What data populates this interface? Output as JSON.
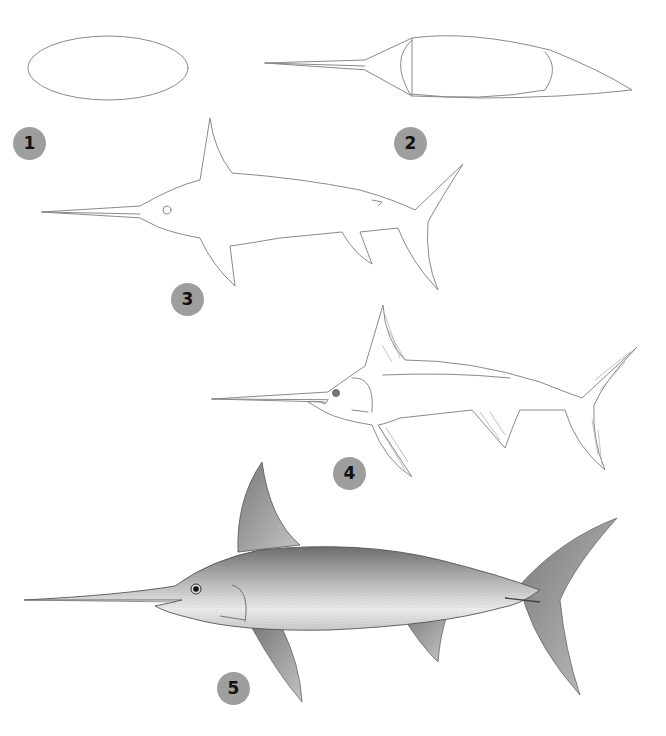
{
  "badge_color": "#9e9e9e",
  "badge_text_color": "#111111",
  "steps": [
    {
      "number": "1",
      "description": "Oval body shape"
    },
    {
      "number": "2",
      "description": "Sword and tapering tail guidelines"
    },
    {
      "number": "3",
      "description": "Outline with fins and eye"
    },
    {
      "number": "4",
      "description": "Refined outline with fin hatching and gill"
    },
    {
      "number": "5",
      "description": "Fully shaded pencil swordfish"
    }
  ]
}
